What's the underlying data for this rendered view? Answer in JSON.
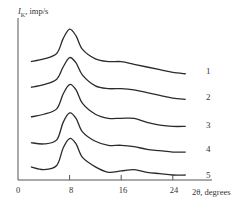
{
  "chart_data": {
    "type": "line",
    "title": "",
    "xlabel": "2θ, degrees",
    "ylabel": "I_K, imp/s",
    "xlim": [
      0,
      28
    ],
    "xticks": [
      0,
      8,
      16,
      24
    ],
    "yticks": [],
    "grid": false,
    "legend": "curve numbers labeled at right end of each curve",
    "note": "Stacked (vertically offset) XRD diffraction patterns; y values are relative intensity in arbitrary units including offset.",
    "x": [
      2,
      4,
      6,
      7,
      8,
      9,
      10,
      12,
      14,
      16,
      18,
      20,
      22,
      24,
      26
    ],
    "series": [
      {
        "name": "1",
        "values": [
          84,
          86,
          90,
          101,
          108,
          103,
          93,
          86,
          84,
          84,
          82,
          80,
          78,
          76,
          75
        ]
      },
      {
        "name": "2",
        "values": [
          65,
          67,
          71,
          80,
          87,
          83,
          74,
          66,
          64,
          64,
          63,
          61,
          59,
          57,
          56
        ]
      },
      {
        "name": "3",
        "values": [
          43,
          45,
          49,
          60,
          67,
          63,
          53,
          45,
          42,
          42,
          42,
          39,
          37,
          36,
          36
        ]
      },
      {
        "name": "4",
        "values": [
          24,
          23,
          26,
          39,
          46,
          42,
          32,
          25,
          22,
          22,
          21,
          19,
          18,
          17,
          17
        ]
      },
      {
        "name": "5",
        "values": [
          6,
          4,
          7,
          20,
          27,
          23,
          13,
          6,
          2,
          3,
          4,
          2,
          1,
          0,
          0
        ]
      }
    ]
  },
  "labels": {
    "y_axis_symbol": "I",
    "y_axis_sub": "K",
    "y_axis_unit": ", imp/s",
    "x_axis": "2θ, degrees",
    "ticks": [
      "0",
      "8",
      "16",
      "24"
    ],
    "curves": [
      "1",
      "2",
      "3",
      "4",
      "5"
    ]
  },
  "style": {
    "line_color": "#2b2b2b",
    "axis_color": "#555555"
  }
}
